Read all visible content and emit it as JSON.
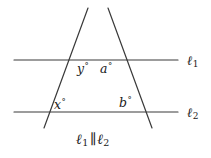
{
  "figure": {
    "background_color": "#ffffff",
    "stroke_color": "#3a3a3a",
    "text_color": "#1b1b1b",
    "width": 211,
    "height": 158
  },
  "lines": {
    "l1": {
      "name": "ℓ1",
      "label_letter": "ℓ",
      "label_sub": "1",
      "y": 60,
      "x_start": 14,
      "x_end": 178
    },
    "l2": {
      "name": "ℓ2",
      "label_letter": "ℓ",
      "label_sub": "2",
      "y": 112,
      "x_start": 14,
      "x_end": 178
    },
    "transversal_left": {
      "name": "left-transversal",
      "x1": 88,
      "y1": 8,
      "x2": 44,
      "y2": 128
    },
    "transversal_right": {
      "name": "right-transversal",
      "x1": 108,
      "y1": 8,
      "x2": 152,
      "y2": 128
    },
    "intersection_apex": {
      "x": 98,
      "y": 22
    }
  },
  "angles": [
    {
      "id": "y",
      "label": "y",
      "degree_symbol": "°",
      "x": 77,
      "y": 62
    },
    {
      "id": "a",
      "label": "a",
      "degree_symbol": "°",
      "x": 100,
      "y": 62
    },
    {
      "id": "x",
      "label": "x",
      "degree_symbol": "°",
      "x": 54,
      "y": 98
    },
    {
      "id": "b",
      "label": "b",
      "degree_symbol": "°",
      "x": 119,
      "y": 96
    }
  ],
  "caption": {
    "text": "ℓ1 ∥ ℓ2",
    "letter1": "ℓ",
    "sub1": "1",
    "parallel_symbol": "∥",
    "letter2": "ℓ",
    "sub2": "2"
  }
}
